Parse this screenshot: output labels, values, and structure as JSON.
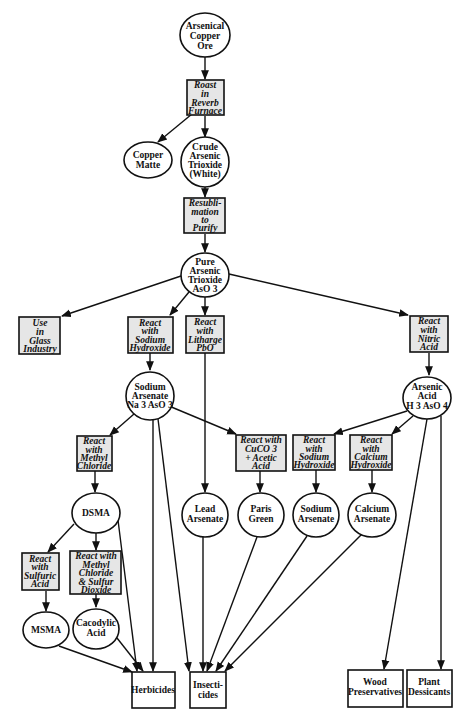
{
  "diagram": {
    "type": "flowchart",
    "colors": {
      "process_fill": "#e6e6e6",
      "stroke": "#111111",
      "background": "#ffffff"
    },
    "nodes": [
      {
        "id": "ore",
        "shape": "ellipse",
        "lines": [
          "Arsenical",
          "Copper",
          "Ore"
        ]
      },
      {
        "id": "roast",
        "shape": "process",
        "lines": [
          "Roast",
          "in",
          "Reverb",
          "Furnace"
        ]
      },
      {
        "id": "matte",
        "shape": "ellipse",
        "lines": [
          "Copper",
          "Matte"
        ]
      },
      {
        "id": "crude",
        "shape": "ellipse",
        "lines": [
          "Crude",
          "Arsenic",
          "Trioxide",
          "(White)"
        ]
      },
      {
        "id": "resub",
        "shape": "process",
        "lines": [
          "Resubli-",
          "mation",
          "to",
          "Purify"
        ]
      },
      {
        "id": "pure",
        "shape": "ellipse",
        "lines": [
          "Pure",
          "Arsenic",
          "Trioxide",
          "AsO 3"
        ]
      },
      {
        "id": "glass",
        "shape": "process",
        "lines": [
          "Use",
          "in",
          "Glass",
          "Industry"
        ]
      },
      {
        "id": "naoh1",
        "shape": "process",
        "lines": [
          "React",
          "with",
          "Sodium",
          "Hydroxide"
        ]
      },
      {
        "id": "pbo",
        "shape": "process",
        "lines": [
          "React",
          "with",
          "Litharge",
          "PbO"
        ]
      },
      {
        "id": "nitric",
        "shape": "process",
        "lines": [
          "React",
          "with",
          "Nitric",
          "Acid"
        ]
      },
      {
        "id": "naars",
        "shape": "ellipse",
        "lines": [
          "Sodium",
          "Arsenate",
          "Na 3 AsO 3"
        ]
      },
      {
        "id": "acid",
        "shape": "ellipse",
        "lines": [
          "Arsenic",
          "Acid",
          "H 3 AsO 4"
        ]
      },
      {
        "id": "mecl",
        "shape": "process",
        "lines": [
          "React",
          "with",
          "Methyl",
          "Chloride"
        ]
      },
      {
        "id": "cuco3",
        "shape": "process",
        "lines": [
          "React with",
          "CuCO 3",
          "+ Acetic",
          "Acid"
        ]
      },
      {
        "id": "naoh2",
        "shape": "process",
        "lines": [
          "React",
          "with",
          "Sodium",
          "Hydroxide"
        ]
      },
      {
        "id": "caoh",
        "shape": "process",
        "lines": [
          "React",
          "with",
          "Calcium",
          "Hydroxide"
        ]
      },
      {
        "id": "dsma",
        "shape": "ellipse",
        "lines": [
          "DSMA"
        ]
      },
      {
        "id": "lead",
        "shape": "ellipse",
        "lines": [
          "Lead",
          "Arsenate"
        ]
      },
      {
        "id": "paris",
        "shape": "ellipse",
        "lines": [
          "Paris",
          "Green"
        ]
      },
      {
        "id": "naars2",
        "shape": "ellipse",
        "lines": [
          "Sodium",
          "Arsenate"
        ]
      },
      {
        "id": "caars",
        "shape": "ellipse",
        "lines": [
          "Calcium",
          "Arsenate"
        ]
      },
      {
        "id": "sulf",
        "shape": "process",
        "lines": [
          "React",
          "with",
          "Sulfuric",
          "Acid"
        ]
      },
      {
        "id": "meso2",
        "shape": "process",
        "lines": [
          "React with",
          "Methyl",
          "Chloride",
          "& Sulfur",
          "Dioxide"
        ]
      },
      {
        "id": "msma",
        "shape": "ellipse",
        "lines": [
          "MSMA"
        ]
      },
      {
        "id": "caco",
        "shape": "ellipse",
        "lines": [
          "Cacodylic",
          "Acid"
        ]
      },
      {
        "id": "herb",
        "shape": "output",
        "lines": [
          "Herbicides"
        ]
      },
      {
        "id": "insect",
        "shape": "output",
        "lines": [
          "Insecti-",
          "cides"
        ]
      },
      {
        "id": "wood",
        "shape": "output",
        "lines": [
          "Wood",
          "Preservatives"
        ]
      },
      {
        "id": "plant",
        "shape": "output",
        "lines": [
          "Plant",
          "Dessicants"
        ]
      }
    ],
    "edges": [
      [
        "ore",
        "roast"
      ],
      [
        "roast",
        "matte"
      ],
      [
        "roast",
        "crude"
      ],
      [
        "crude",
        "resub"
      ],
      [
        "resub",
        "pure"
      ],
      [
        "pure",
        "glass"
      ],
      [
        "pure",
        "naoh1"
      ],
      [
        "pure",
        "pbo"
      ],
      [
        "pure",
        "nitric"
      ],
      [
        "naoh1",
        "naars"
      ],
      [
        "pbo",
        "lead"
      ],
      [
        "nitric",
        "acid"
      ],
      [
        "naars",
        "mecl"
      ],
      [
        "naars",
        "cuco3"
      ],
      [
        "naars",
        "herb"
      ],
      [
        "naars",
        "insect"
      ],
      [
        "acid",
        "naoh2"
      ],
      [
        "acid",
        "caoh"
      ],
      [
        "acid",
        "wood"
      ],
      [
        "acid",
        "plant"
      ],
      [
        "mecl",
        "dsma"
      ],
      [
        "cuco3",
        "paris"
      ],
      [
        "naoh2",
        "naars2"
      ],
      [
        "caoh",
        "caars"
      ],
      [
        "dsma",
        "sulf"
      ],
      [
        "dsma",
        "meso2"
      ],
      [
        "dsma",
        "herb"
      ],
      [
        "sulf",
        "msma"
      ],
      [
        "meso2",
        "caco"
      ],
      [
        "msma",
        "herb"
      ],
      [
        "caco",
        "herb"
      ],
      [
        "lead",
        "insect"
      ],
      [
        "paris",
        "insect"
      ],
      [
        "naars2",
        "insect"
      ],
      [
        "caars",
        "insect"
      ]
    ]
  }
}
